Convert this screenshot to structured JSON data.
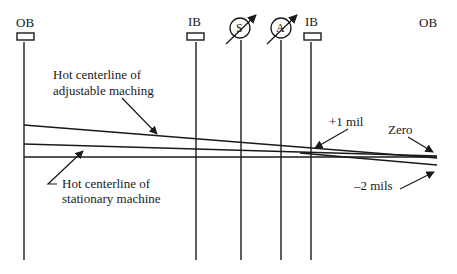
{
  "diagram": {
    "bearing_labels": {
      "left_ob": "OB",
      "ib_1": "IB",
      "ib_2": "IB",
      "right_ob": "OB"
    },
    "gauge_labels": {
      "s": "S",
      "a": "A"
    },
    "callouts": {
      "adjustable_line1": "Hot centerline of",
      "adjustable_line2": "adjustable maching",
      "stationary_line1": "Hot centerline of",
      "stationary_line2": "stationary machine",
      "plus_one": "+1 mil",
      "zero": "Zero",
      "minus_two": "–2 mils"
    },
    "colors": {
      "stroke": "#1a1a1a",
      "background": "#ffffff"
    }
  }
}
